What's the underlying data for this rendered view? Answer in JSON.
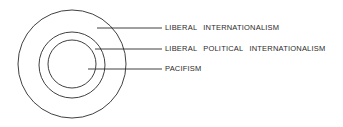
{
  "diagram": {
    "colors": {
      "stroke": "#2a2a2a",
      "background": "#ffffff"
    },
    "circles": [
      {
        "name": "outer",
        "cx": 72,
        "cy": 64,
        "r": 54
      },
      {
        "name": "middle",
        "cx": 72,
        "cy": 65,
        "r": 33
      },
      {
        "name": "inner",
        "cx": 72,
        "cy": 64,
        "r": 24
      }
    ],
    "labels": [
      {
        "text": "LIBERAL  INTERNATIONALISM",
        "line_y": 28
      },
      {
        "text": "LIBERAL  POLITICAL  INTERNATIONALISM",
        "line_y": 49
      },
      {
        "text": "PACIFISM",
        "line_y": 69
      }
    ]
  }
}
